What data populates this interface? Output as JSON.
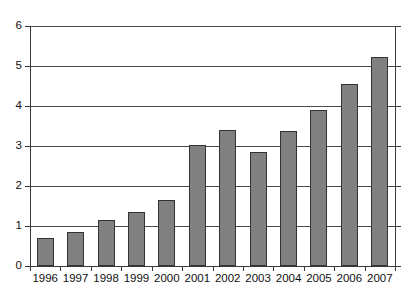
{
  "chart_data": {
    "type": "bar",
    "title": "",
    "subtitle": "",
    "xlabel": "",
    "ylabel": "",
    "categories": [
      "1996",
      "1997",
      "1998",
      "1999",
      "2000",
      "2001",
      "2002",
      "2003",
      "2004",
      "2005",
      "2006",
      "2007"
    ],
    "values": [
      0.7,
      0.85,
      1.15,
      1.35,
      1.65,
      3.02,
      3.4,
      2.85,
      3.38,
      3.9,
      4.55,
      5.22
    ],
    "series": [
      {
        "name": "",
        "values": [
          0.7,
          0.85,
          1.15,
          1.35,
          1.65,
          3.02,
          3.4,
          2.85,
          3.38,
          3.9,
          4.55,
          5.22
        ]
      }
    ],
    "ylim": [
      0,
      6
    ],
    "yticks": [
      0,
      1,
      2,
      3,
      4,
      5,
      6
    ],
    "ytick_labels": [
      "0",
      "1",
      "2",
      "3",
      "3",
      "4",
      "6"
    ],
    "grid": true,
    "grid_axis": "y",
    "legend": false,
    "legend_position": "none",
    "bar_color": "#808080",
    "bar_border_color": "#333333",
    "axis_color": "#3a3a3a",
    "grid_color": "#4a4a4a",
    "background_color": "#ffffff",
    "text_color": "#111111"
  },
  "axis": {
    "y_tick_labels": [
      "6",
      "5",
      "4",
      "3",
      "2",
      "1",
      "0"
    ],
    "y_tick_values": [
      6,
      5,
      4,
      3,
      2,
      1,
      0
    ]
  }
}
